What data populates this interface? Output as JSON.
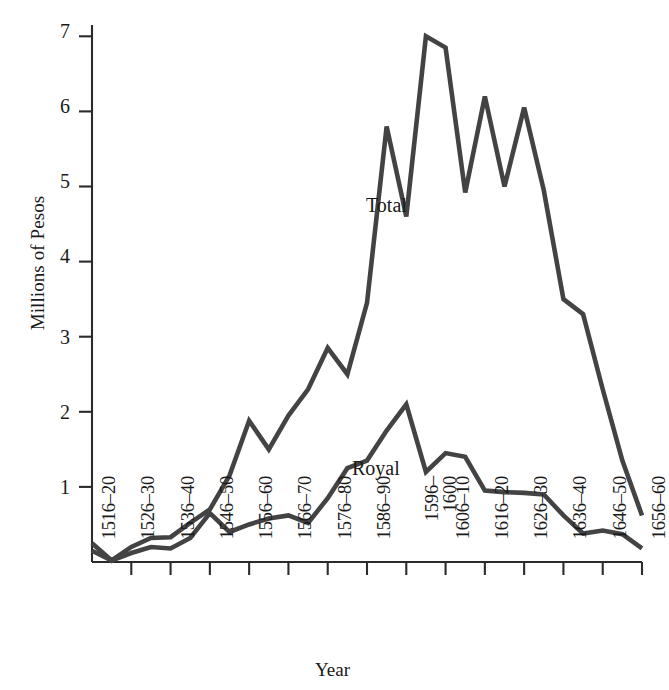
{
  "chart_data": {
    "type": "line",
    "title": "",
    "xlabel": "Year",
    "ylabel": "Millions of Pesos",
    "ylim": [
      0,
      7.4
    ],
    "yticks": [
      1,
      2,
      3,
      4,
      5,
      6,
      7
    ],
    "ytick_labels": [
      "1",
      "2",
      "3",
      "4",
      "5",
      "6",
      "7"
    ],
    "grid": false,
    "legend_position": "inline-annotations",
    "categories": [
      "1516–20",
      "1526–30",
      "1536–40",
      "1546–50",
      "1556–60",
      "1566–70",
      "1576–80",
      "1586–90",
      "1596–1600",
      "1606–10",
      "1616–20",
      "1626–30",
      "1636–40",
      "1646–50",
      "1656–60"
    ],
    "category_label_lines": [
      [
        "1516–20"
      ],
      [
        "1526–30"
      ],
      [
        "1536–40"
      ],
      [
        "1546–50"
      ],
      [
        "1556–60"
      ],
      [
        "1566–70"
      ],
      [
        "1576–80"
      ],
      [
        "1586–90"
      ],
      [
        "1596–",
        "1600"
      ],
      [
        "1606–10"
      ],
      [
        "1616–20"
      ],
      [
        "1626–30"
      ],
      [
        "1636–40"
      ],
      [
        "1646–50"
      ],
      [
        "1656–60"
      ]
    ],
    "x_subdivisions_per_category": 2,
    "series": [
      {
        "name": "Total",
        "color": "#434343",
        "x": [
          0,
          0.5,
          1,
          1.5,
          2,
          2.5,
          3,
          3.5,
          4,
          4.5,
          5,
          5.5,
          6,
          6.5,
          7,
          7.5,
          8,
          8.5,
          9,
          9.5,
          10,
          10.5,
          11,
          11.5,
          12,
          12.5,
          13,
          13.5,
          14
        ],
        "values": [
          0.25,
          0.02,
          0.2,
          0.32,
          0.33,
          0.52,
          0.7,
          1.15,
          1.88,
          1.5,
          1.95,
          2.3,
          2.85,
          2.5,
          3.45,
          5.8,
          4.6,
          7.0,
          6.85,
          4.92,
          6.2,
          5.0,
          6.05,
          4.95,
          3.5,
          3.3,
          2.3,
          1.35,
          0.62
        ]
      },
      {
        "name": "Royal",
        "color": "#434343",
        "x": [
          0,
          0.5,
          1,
          1.5,
          2,
          2.5,
          3,
          3.5,
          4,
          4.5,
          5,
          5.5,
          6,
          6.5,
          7,
          7.5,
          8,
          8.5,
          9,
          9.5,
          10,
          10.5,
          11,
          11.5,
          12,
          12.5,
          13,
          13.5,
          14
        ],
        "values": [
          0.15,
          0.02,
          0.12,
          0.2,
          0.18,
          0.32,
          0.65,
          0.4,
          0.5,
          0.58,
          0.62,
          0.52,
          0.85,
          1.25,
          1.35,
          1.75,
          2.1,
          1.2,
          1.45,
          1.4,
          0.95,
          0.93,
          0.92,
          0.9,
          0.62,
          0.38,
          0.42,
          0.37,
          0.18
        ]
      }
    ],
    "annotations": [
      {
        "text": "Total",
        "series": "Total"
      },
      {
        "text": "Royal",
        "series": "Royal"
      }
    ]
  },
  "axes": {
    "y_title": "Millions of Pesos",
    "x_title": "Year"
  },
  "colors": {
    "background": "#ffffff",
    "axis": "#2b2b2b",
    "line": "#434343",
    "text": "#1a1a1a"
  }
}
